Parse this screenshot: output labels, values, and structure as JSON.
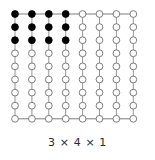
{
  "figure": {
    "caption": "3 × 4 × 1",
    "lattice": {
      "columns": 8,
      "rows": 9,
      "x_start": 15,
      "y_start": 14,
      "x_step": 16.9,
      "y_step": 13.1,
      "node_radius": 3.4,
      "filled_columns": 4,
      "filled_rows": 3,
      "filled_color": "#000000",
      "empty_color": "#ffffff",
      "node_stroke_color": "#6e6e6e",
      "node_stroke_width": 0.9,
      "vertical_line_color": "#8a8a8a",
      "vertical_line_width": 0.9,
      "horizontal_line_color": "#6e6e6e",
      "horizontal_line_width": 0.9,
      "horizontal_line_rows": [
        0,
        8
      ]
    }
  }
}
